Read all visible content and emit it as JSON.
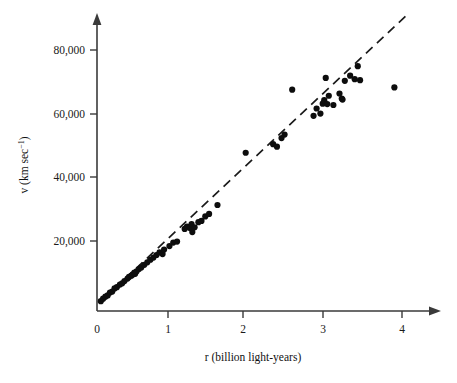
{
  "figure": {
    "background_color": "#ffffff",
    "ink_color": "#1a1a1a"
  },
  "chart_data": {
    "type": "scatter",
    "title": "",
    "subtitle": "",
    "xlabel": "r (billion light-years)",
    "ylabel": "v (km sec−1)",
    "ylabel_parts": {
      "main": "v (km sec",
      "exponent": "−1",
      "tail": ")"
    },
    "xlim": [
      0,
      4.35
    ],
    "ylim": [
      0,
      88000
    ],
    "grid": false,
    "legend": null,
    "x_ticks": [
      0,
      1,
      2,
      3,
      4
    ],
    "x_ticklabels": [
      "0",
      "1",
      "2",
      "3",
      "4"
    ],
    "y_ticks": [
      20000,
      40000,
      60000,
      80000
    ],
    "y_ticklabels": [
      "20,000",
      "40,000",
      "60,000",
      "80,000"
    ],
    "axis_style": "arrow-tipped L-axes, ticks outside",
    "marker": {
      "shape": "circle",
      "color": "#0d0d0d",
      "size_px": 4.4
    },
    "fit_line": {
      "style": "dashed",
      "color": "#1a1a1a",
      "slope_km_s_per_blyr": 22400,
      "intercept_km_s": 0,
      "x_start": 0.08,
      "x_end": 4.05,
      "label": "Hubble law fit"
    },
    "points": [
      [
        0.05,
        1200
      ],
      [
        0.08,
        2000
      ],
      [
        0.11,
        2600
      ],
      [
        0.14,
        3000
      ],
      [
        0.17,
        3900
      ],
      [
        0.2,
        4200
      ],
      [
        0.23,
        5200
      ],
      [
        0.26,
        5600
      ],
      [
        0.3,
        6400
      ],
      [
        0.33,
        6800
      ],
      [
        0.36,
        7500
      ],
      [
        0.4,
        8300
      ],
      [
        0.42,
        8800
      ],
      [
        0.45,
        9200
      ],
      [
        0.47,
        9600
      ],
      [
        0.49,
        10200
      ],
      [
        0.5,
        9800
      ],
      [
        0.52,
        10600
      ],
      [
        0.55,
        11300
      ],
      [
        0.58,
        11800
      ],
      [
        0.62,
        12600
      ],
      [
        0.66,
        13400
      ],
      [
        0.7,
        14200
      ],
      [
        0.74,
        14900
      ],
      [
        0.78,
        15700
      ],
      [
        0.82,
        16500
      ],
      [
        0.86,
        16000
      ],
      [
        0.88,
        17400
      ],
      [
        0.95,
        18500
      ],
      [
        1.0,
        19600
      ],
      [
        1.05,
        19900
      ],
      [
        1.15,
        23900
      ],
      [
        1.18,
        24600
      ],
      [
        1.22,
        24200
      ],
      [
        1.24,
        25400
      ],
      [
        1.25,
        22900
      ],
      [
        1.28,
        24400
      ],
      [
        1.33,
        26000
      ],
      [
        1.37,
        26400
      ],
      [
        1.42,
        27800
      ],
      [
        1.47,
        28600
      ],
      [
        1.58,
        31400
      ],
      [
        1.95,
        47800
      ],
      [
        2.31,
        50500
      ],
      [
        2.36,
        49700
      ],
      [
        2.42,
        52400
      ],
      [
        2.46,
        53500
      ],
      [
        2.56,
        67600
      ],
      [
        2.84,
        59400
      ],
      [
        2.88,
        61700
      ],
      [
        2.93,
        60100
      ],
      [
        2.96,
        63200
      ],
      [
        2.98,
        64300
      ],
      [
        3.0,
        71300
      ],
      [
        3.02,
        63100
      ],
      [
        3.04,
        65700
      ],
      [
        3.1,
        62800
      ],
      [
        3.18,
        66400
      ],
      [
        3.21,
        64800
      ],
      [
        3.22,
        64500
      ],
      [
        3.25,
        70400
      ],
      [
        3.32,
        72000
      ],
      [
        3.38,
        70900
      ],
      [
        3.42,
        75000
      ],
      [
        3.45,
        70600
      ],
      [
        3.9,
        68300
      ]
    ]
  }
}
